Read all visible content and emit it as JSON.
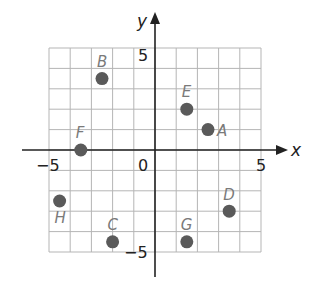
{
  "figure": {
    "type": "coordinate-plane",
    "x_axis_label": "x",
    "y_axis_label": "y",
    "tick_labels": {
      "x_min": "−5",
      "x_max": "5",
      "y_max": "5",
      "y_min": "−5",
      "origin": "0"
    },
    "colors": {
      "grid": "#b5b5b5",
      "axis": "#222222",
      "point": "#5a5a5a",
      "label": "#7a7a7a"
    }
  },
  "chart_data": {
    "type": "scatter",
    "title": "",
    "xlabel": "x",
    "ylabel": "y",
    "xlim": [
      -5,
      5
    ],
    "ylim": [
      -5,
      5
    ],
    "grid": true,
    "grid_step": 1,
    "points": [
      {
        "label": "A",
        "x": 2.5,
        "y": 1
      },
      {
        "label": "B",
        "x": -2.5,
        "y": 3.5
      },
      {
        "label": "C",
        "x": -2,
        "y": -4.5
      },
      {
        "label": "D",
        "x": 3.5,
        "y": -3
      },
      {
        "label": "E",
        "x": 1.5,
        "y": 2
      },
      {
        "label": "F",
        "x": -3.5,
        "y": 0
      },
      {
        "label": "G",
        "x": 1.5,
        "y": -4.5
      },
      {
        "label": "H",
        "x": -4.5,
        "y": -2.5
      }
    ]
  }
}
